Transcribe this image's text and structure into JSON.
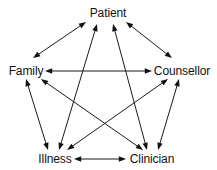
{
  "diagram": {
    "type": "node-link-diagram",
    "background_color": "#ffffff",
    "line_color": "#1a1a1a",
    "text_color": "#111111",
    "nodes": [
      {
        "id": "patient",
        "label": "Patient",
        "x": 108,
        "y": 13
      },
      {
        "id": "family",
        "label": "Family",
        "x": 26,
        "y": 71
      },
      {
        "id": "counsellor",
        "label": "Counsellor",
        "x": 182,
        "y": 71
      },
      {
        "id": "illness",
        "label": "Illness",
        "x": 55,
        "y": 159
      },
      {
        "id": "clinician",
        "label": "Clinician",
        "x": 152,
        "y": 159
      }
    ],
    "edges": [
      {
        "id": "family-patient",
        "from": "family",
        "to": "patient",
        "bidirectional": true,
        "x1": 33,
        "y1": 58,
        "x2": 86,
        "y2": 22
      },
      {
        "id": "patient-counsellor",
        "from": "patient",
        "to": "counsellor",
        "bidirectional": true,
        "x1": 126,
        "y1": 22,
        "x2": 172,
        "y2": 58
      },
      {
        "id": "family-counsellor",
        "from": "family",
        "to": "counsellor",
        "bidirectional": true,
        "x1": 45,
        "y1": 71,
        "x2": 152,
        "y2": 71
      },
      {
        "id": "family-illness",
        "from": "family",
        "to": "illness",
        "bidirectional": true,
        "x1": 26,
        "y1": 79,
        "x2": 48,
        "y2": 150
      },
      {
        "id": "counsellor-clinician",
        "from": "counsellor",
        "to": "clinician",
        "bidirectional": true,
        "x1": 179,
        "y1": 79,
        "x2": 158,
        "y2": 150
      },
      {
        "id": "illness-clinician",
        "from": "illness",
        "to": "clinician",
        "bidirectional": true,
        "x1": 74,
        "y1": 159,
        "x2": 126,
        "y2": 159
      },
      {
        "id": "patient-illness",
        "from": "patient",
        "to": "illness",
        "bidirectional": true,
        "x1": 97,
        "y1": 24,
        "x2": 59,
        "y2": 150
      },
      {
        "id": "patient-clinician",
        "from": "patient",
        "to": "clinician",
        "bidirectional": true,
        "x1": 113,
        "y1": 24,
        "x2": 147,
        "y2": 150
      },
      {
        "id": "family-clinician",
        "from": "family",
        "to": "clinician",
        "bidirectional": true,
        "x1": 41,
        "y1": 79,
        "x2": 143,
        "y2": 150
      },
      {
        "id": "illness-counsellor",
        "from": "illness",
        "to": "counsellor",
        "bidirectional": true,
        "x1": 67,
        "y1": 150,
        "x2": 168,
        "y2": 79
      }
    ]
  }
}
